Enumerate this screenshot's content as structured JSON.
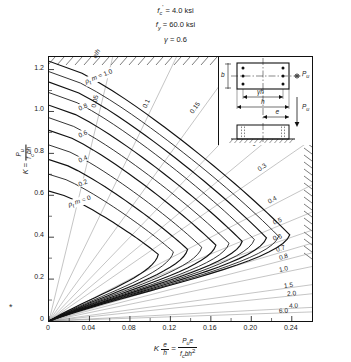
{
  "header": {
    "fc_symbol": "f",
    "fc_sub": "c",
    "fc_prime": "'",
    "fc_eq": "=",
    "fc_value": "4.0 ksi",
    "fy_symbol": "f",
    "fy_sub": "y",
    "fy_eq": "=",
    "fy_value": "60.0 ksi",
    "gamma_symbol": "γ",
    "gamma_eq": "=",
    "gamma_value": "0.6"
  },
  "axes": {
    "y_label_k": "K",
    "y_label_eq": "=",
    "y_num": "P",
    "y_num_sub": "u",
    "y_den_f": "f",
    "y_den_sub": "c",
    "y_den_rest": "bh",
    "x_label_k": "K",
    "x_label_e": "e",
    "x_label_h": "h",
    "x_label_eq": "=",
    "x_num": "P",
    "x_num_sub": "u",
    "x_num_e": "e",
    "x_den_f": "f",
    "x_den_sub": "c",
    "x_den_rest": "bh",
    "x_den_sup": "2",
    "yticks": [
      "1.2",
      "1.0",
      "0.8",
      "0.6",
      "0.4",
      "0.2",
      "0"
    ],
    "ytick_values": [
      1.2,
      1.0,
      0.8,
      0.6,
      0.4,
      0.2,
      0.0
    ],
    "xticks": [
      "0",
      "0.04",
      "0.08",
      "0.12",
      "0.16",
      "0.20",
      "0.24"
    ],
    "xtick_values": [
      0,
      0.04,
      0.08,
      0.12,
      0.16,
      0.2,
      0.24
    ],
    "xlim": [
      0,
      0.26
    ],
    "ylim": [
      0,
      1.26
    ]
  },
  "inset": {
    "b_label": "b",
    "gamma_h_label": "γh",
    "h_label": "h",
    "e_label": "e",
    "pu_label_top": "P",
    "pu_sub_top": "u",
    "pu_label_side": "P",
    "pu_sub_side": "u"
  },
  "legend": {
    "rho_family_label": "ρ",
    "rho_family_sub": "t",
    "rho_family_m": "m",
    "rho_family_eq": "=",
    "eh_label": "e",
    "eh_slash": "/",
    "eh_h": "h"
  },
  "chart_data": {
    "type": "line",
    "subtitle": "f'c = 4.0 ksi, fy = 60.0 ksi, γ = 0.6",
    "xlabel": "K e/h = Pu e / (f'c b h²)",
    "ylabel": "K = Pu / (f'c b h)",
    "xlim": [
      0,
      0.26
    ],
    "ylim": [
      0,
      1.26
    ],
    "grid": false,
    "legend_position": "in-plot",
    "families": [
      {
        "name": "rho_t_m",
        "label": "ρt m",
        "description": "Reinforcement index contours (heavy curves)",
        "values": [
          0.0,
          0.1,
          0.2,
          0.3,
          0.4,
          0.5,
          0.6,
          0.7,
          0.8,
          0.9,
          1.0
        ],
        "labeled": [
          "0",
          "0.2",
          "0.4",
          "0.6",
          "0.8",
          "1.0"
        ],
        "kmax": [
          0.62,
          0.7,
          0.77,
          0.84,
          0.91,
          0.97,
          1.03,
          1.09,
          1.14,
          1.19,
          1.24
        ],
        "balanced_point": [
          {
            "rho_t_m": 0.0,
            "x": 0.108,
            "y": 0.318
          },
          {
            "rho_t_m": 0.1,
            "x": 0.123,
            "y": 0.33
          },
          {
            "rho_t_m": 0.2,
            "x": 0.137,
            "y": 0.342
          },
          {
            "rho_t_m": 0.3,
            "x": 0.151,
            "y": 0.352
          },
          {
            "rho_t_m": 0.4,
            "x": 0.165,
            "y": 0.362
          },
          {
            "rho_t_m": 0.5,
            "x": 0.178,
            "y": 0.371
          },
          {
            "rho_t_m": 0.6,
            "x": 0.191,
            "y": 0.38
          },
          {
            "rho_t_m": 0.7,
            "x": 0.203,
            "y": 0.389
          },
          {
            "rho_t_m": 0.8,
            "x": 0.215,
            "y": 0.397
          },
          {
            "rho_t_m": 0.9,
            "x": 0.227,
            "y": 0.404
          },
          {
            "rho_t_m": 1.0,
            "x": 0.238,
            "y": 0.411
          }
        ]
      },
      {
        "name": "e_over_h",
        "label": "e/h",
        "description": "Eccentricity ratio rays from the origin (light lines)",
        "values": [
          0.05,
          0.1,
          0.15,
          0.2,
          0.25,
          0.3,
          0.4,
          0.5,
          0.6,
          0.7,
          0.8,
          1.0,
          1.5,
          2.0,
          4.0,
          6.0
        ],
        "labels_top": [
          "0.05",
          "0.1",
          "0.15",
          "0.2",
          "0.25",
          "0.3"
        ],
        "labels_right": [
          "0.4",
          "0.5",
          "0.6",
          "0.7",
          "0.8",
          "1.0",
          "1.5",
          "2.0",
          "4.0",
          "6.0"
        ]
      }
    ]
  },
  "colors": {
    "ink": "#111111",
    "light_line": "#8a8a8a",
    "heavy_line": "#111111",
    "background": "#ffffff"
  }
}
